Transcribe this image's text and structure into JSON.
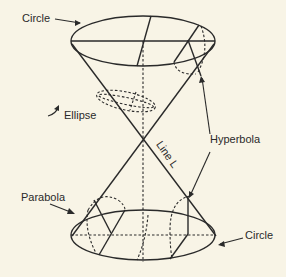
{
  "diagram": {
    "background": "#f8f4e6",
    "stroke": "#2a2a2a",
    "labels": {
      "circle_top": "Circle",
      "ellipse": "Ellipse",
      "hyperbola": "Hyperbola",
      "line_l": "Line L",
      "parabola": "Parabola",
      "circle_bottom": "Circle"
    }
  }
}
